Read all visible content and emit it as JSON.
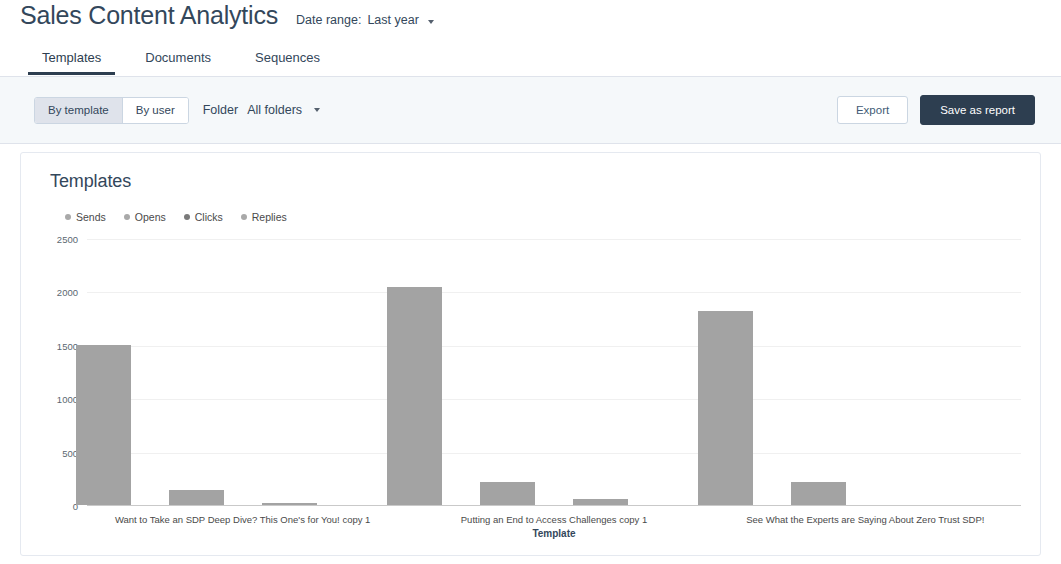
{
  "header": {
    "title": "Sales Content Analytics",
    "date_range_label": "Date range:",
    "date_range_value": "Last year",
    "caret_icon": "chevron-down-icon"
  },
  "tabs": [
    {
      "label": "Templates",
      "active": true
    },
    {
      "label": "Documents",
      "active": false
    },
    {
      "label": "Sequences",
      "active": false
    }
  ],
  "toolbar": {
    "segmented": [
      {
        "label": "By template",
        "selected": true
      },
      {
        "label": "By user",
        "selected": false
      }
    ],
    "folder_label": "Folder",
    "folder_value": "All folders",
    "folder_caret_icon": "chevron-down-icon",
    "export_label": "Export",
    "save_report_label": "Save as report"
  },
  "card": {
    "title": "Templates"
  },
  "chart_data": {
    "type": "bar",
    "title": "Templates",
    "xlabel": "Template",
    "ylabel": "",
    "ylim": [
      0,
      2500
    ],
    "yticks": [
      0,
      500,
      1000,
      1500,
      2000,
      2500
    ],
    "ytick_labels": [
      "0",
      "500",
      "1000",
      "1500",
      "2000",
      "2500"
    ],
    "grid": true,
    "legend_position": "top-left",
    "categories": [
      "Want to Take an SDP Deep Dive? This One's for You! copy 1",
      "Putting an End to Access Challenges copy 1",
      "See What the Experts are Saying About Zero Trust SDP!"
    ],
    "series": [
      {
        "name": "Sends",
        "color": "#a3a3a3",
        "values": [
          1500,
          2040,
          1820
        ]
      },
      {
        "name": "Opens",
        "color": "#a3a3a3",
        "values": [
          140,
          215,
          220
        ]
      },
      {
        "name": "Clicks",
        "color": "#a3a3a3",
        "values": [
          20,
          55,
          0
        ]
      },
      {
        "name": "Replies",
        "color": "#a3a3a3",
        "values": [
          0,
          0,
          0
        ]
      }
    ]
  }
}
